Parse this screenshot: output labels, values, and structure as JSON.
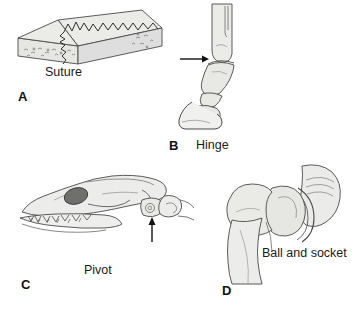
{
  "figure": {
    "background_color": "#ffffff",
    "bone_fill": "#e8e8e6",
    "bone_fill_light": "#f2f2f0",
    "bone_shade": "#d7d7d4",
    "outline_color": "#4a4a4a",
    "eye_socket_color": "#6b6b68",
    "suture_fill": "#dcdcda",
    "text_color": "#1a1a1a"
  },
  "panels": [
    {
      "id": "a",
      "letter": "A",
      "caption": "Suture",
      "joint_type": "suture",
      "subject": "flat-bone-block-with-zigzag-suture",
      "has_arrow": false
    },
    {
      "id": "b",
      "letter": "B",
      "caption": "Hinge",
      "joint_type": "hinge",
      "subject": "horse-lower-limb-fetlock-and-hoof",
      "has_arrow": true,
      "arrow_direction": "right"
    },
    {
      "id": "c",
      "letter": "C",
      "caption": "Pivot",
      "joint_type": "pivot",
      "subject": "dog-skull-with-atlas-axis-vertebrae",
      "has_arrow": true,
      "arrow_direction": "up"
    },
    {
      "id": "d",
      "letter": "D",
      "caption": "Ball and socket",
      "joint_type": "ball-and-socket",
      "subject": "femur-head-in-hip-acetabulum",
      "has_arrow": false
    }
  ]
}
